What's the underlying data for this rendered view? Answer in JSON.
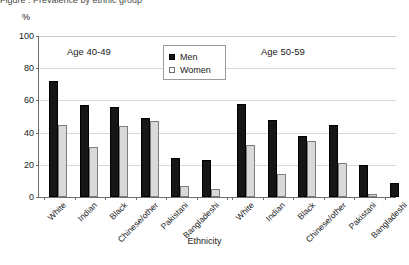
{
  "top_caption": "Figure  : Prevalence by ethnic group",
  "unit_label": "%",
  "xaxis_title": "Ethnicity",
  "legend": {
    "items": [
      {
        "label": "Men",
        "swatch": "men",
        "color": "#161616"
      },
      {
        "label": "Women",
        "swatch": "women",
        "color": "#d9d9d9"
      }
    ]
  },
  "yaxis": {
    "ticks": [
      "0",
      "20",
      "40",
      "60",
      "80",
      "100"
    ],
    "min": 0,
    "max": 100
  },
  "groups": [
    {
      "title": "Age 40-49"
    },
    {
      "title": "Age 50-59"
    }
  ],
  "chart_data": {
    "type": "bar",
    "title": "",
    "xlabel": "Ethnicity",
    "ylabel": "%",
    "ylim": [
      0,
      100
    ],
    "ytick_step": 20,
    "grid": true,
    "legend_position": "inside-top-center",
    "panels": [
      {
        "name": "Age 40-49",
        "categories": [
          "White",
          "Indian",
          "Black",
          "Chinese/other",
          "Pakistani",
          "Bangladeshi"
        ],
        "series": [
          {
            "name": "Men",
            "values": [
              72,
              57,
              56,
              49,
              24,
              23
            ]
          },
          {
            "name": "Women",
            "values": [
              45,
              31,
              44,
              47,
              7,
              5
            ]
          }
        ]
      },
      {
        "name": "Age 50-59",
        "categories": [
          "White",
          "Indian",
          "Black",
          "Chinese/other",
          "Pakistani",
          "Bangladeshi"
        ],
        "series": [
          {
            "name": "Men",
            "values": [
              58,
              48,
              38,
              45,
              20,
              9
            ]
          },
          {
            "name": "Women",
            "values": [
              32,
              14,
              35,
              21,
              2,
              0
            ]
          }
        ]
      }
    ]
  }
}
